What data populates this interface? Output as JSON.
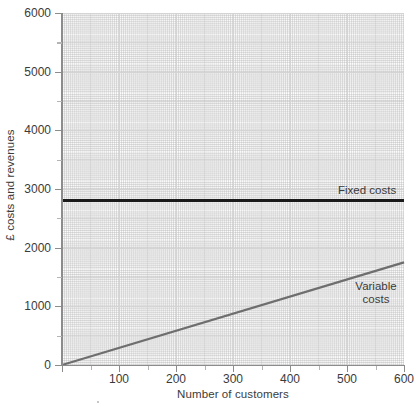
{
  "chart_data": {
    "type": "line",
    "title": "",
    "xlabel": "Number of customers",
    "ylabel": "£ costs and revenues",
    "xlim": [
      0,
      600
    ],
    "ylim": [
      0,
      6000
    ],
    "x_ticks": [
      "0",
      "100",
      "200",
      "300",
      "400",
      "500",
      "600"
    ],
    "x_tick_values": [
      0,
      100,
      200,
      300,
      400,
      500,
      600
    ],
    "y_ticks": [
      "0",
      "1000",
      "2000",
      "3000",
      "4000",
      "5000",
      "6000"
    ],
    "y_tick_values": [
      0,
      1000,
      2000,
      3000,
      4000,
      5000,
      6000
    ],
    "grid": true,
    "grid_minor": true,
    "legend_position": "inline-right",
    "series": [
      {
        "name": "Fixed costs",
        "label": "Fixed costs",
        "color": "#1a1a1a",
        "style": "horizontal-constant",
        "x": [
          0,
          600
        ],
        "values": [
          2800,
          2800
        ],
        "label_x": 505,
        "label_y": 3000
      },
      {
        "name": "Variable costs",
        "label_line1": "Variable",
        "label_line2": "costs",
        "color": "#6e6e6e",
        "style": "linear",
        "x": [
          0,
          600
        ],
        "values": [
          0,
          1750
        ],
        "slope_per_customer": 2.92,
        "label_x": 510,
        "label_y": 1300
      }
    ]
  },
  "annotations": {
    "fixed_costs_label": "Fixed costs",
    "variable_costs_label_line1": "Variable",
    "variable_costs_label_line2": "costs"
  }
}
